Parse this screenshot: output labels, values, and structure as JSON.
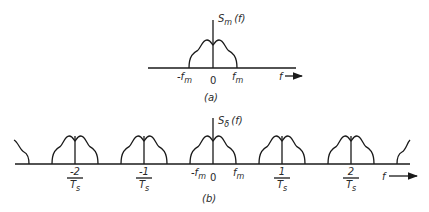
{
  "panel_a": {
    "ylabel": "S",
    "ylabel_sub": "m",
    "ylabel_arg": "(f)",
    "ticks": [
      {
        "id": "neg-fm",
        "text": "-f",
        "sub": "m"
      },
      {
        "id": "zero",
        "text": "0",
        "sub": ""
      },
      {
        "id": "pos-fm",
        "text": "f",
        "sub": "m"
      }
    ],
    "xlabel": "f",
    "caption": "(a)"
  },
  "panel_b": {
    "ylabel": "S",
    "ylabel_sub": "δ",
    "ylabel_arg": "(f)",
    "fractions": [
      {
        "id": "neg2",
        "num": "-2",
        "den": "T",
        "den_sub": "s"
      },
      {
        "id": "neg1",
        "num": "-1",
        "den": "T",
        "den_sub": "s"
      },
      {
        "id": "pos1",
        "num": "1",
        "den": "T",
        "den_sub": "s"
      },
      {
        "id": "pos2",
        "num": "2",
        "den": "T",
        "den_sub": "s"
      }
    ],
    "ticks": [
      {
        "id": "neg-fm",
        "text": "-f",
        "sub": "m"
      },
      {
        "id": "zero",
        "text": "0",
        "sub": ""
      },
      {
        "id": "pos-fm",
        "text": "f",
        "sub": "m"
      }
    ],
    "xlabel": "f",
    "caption": "(b)",
    "replica_centers_in_fs": [
      -2,
      -1,
      0,
      1,
      2
    ]
  }
}
